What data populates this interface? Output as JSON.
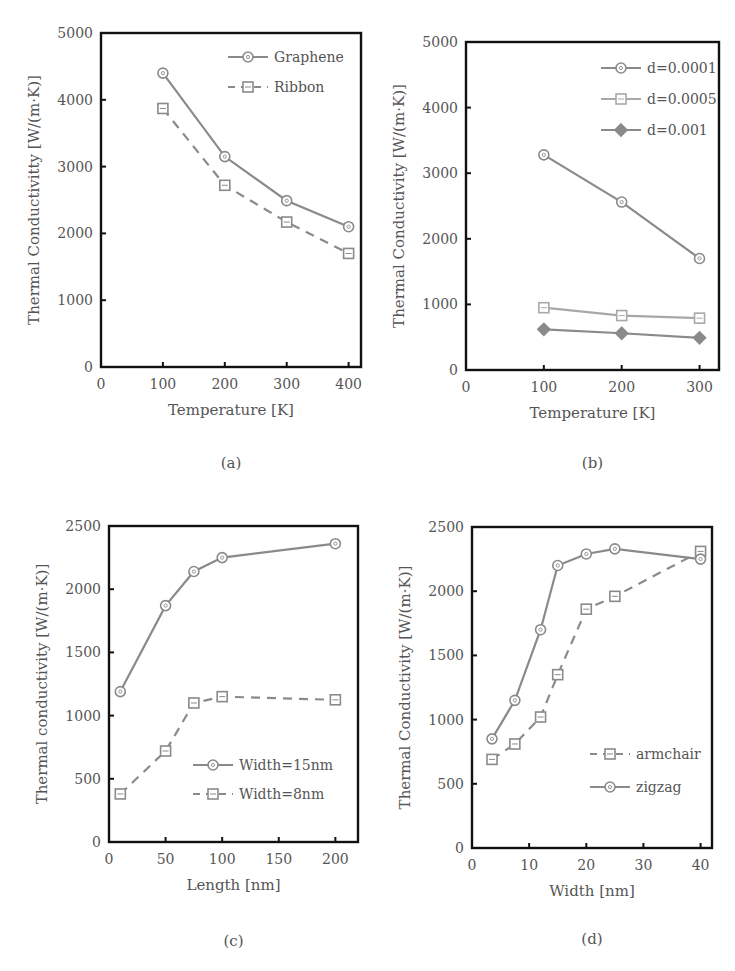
{
  "chart_data": [
    {
      "id": "a",
      "type": "line",
      "caption": "(a)",
      "title": "",
      "xlabel": "Temperature [K]",
      "ylabel": "Thermal Conductivitty [W/(m·K)]",
      "xlim": [
        0,
        420
      ],
      "ylim": [
        0,
        5000
      ],
      "xticks": [
        0,
        100,
        200,
        300,
        400
      ],
      "yticks": [
        0,
        1000,
        2000,
        3000,
        4000,
        5000
      ],
      "grid": false,
      "legend_position": "upper right",
      "series": [
        {
          "name": "Graphene",
          "marker": "circle",
          "dash": false,
          "x": [
            100,
            200,
            300,
            400
          ],
          "values": [
            4400,
            3150,
            2490,
            2100
          ]
        },
        {
          "name": "Ribbon",
          "marker": "square",
          "dash": true,
          "x": [
            100,
            200,
            300,
            400
          ],
          "values": [
            3870,
            2720,
            2170,
            1700
          ]
        }
      ]
    },
    {
      "id": "b",
      "type": "line",
      "caption": "(b)",
      "title": "",
      "xlabel": "Temperature [K]",
      "ylabel": "Thermal Conductivity [W/(m·K)]",
      "xlim": [
        0,
        325
      ],
      "ylim": [
        0,
        5000
      ],
      "xticks": [
        0,
        100,
        200,
        300
      ],
      "yticks": [
        0,
        1000,
        2000,
        3000,
        4000,
        5000
      ],
      "grid": false,
      "legend_position": "upper right",
      "series": [
        {
          "name": "d=0.0001",
          "marker": "circle",
          "dash": false,
          "x": [
            100,
            200,
            300
          ],
          "values": [
            3280,
            2560,
            1700
          ]
        },
        {
          "name": "d=0.0005",
          "marker": "square",
          "dash": false,
          "x": [
            100,
            200,
            300
          ],
          "values": [
            950,
            830,
            790
          ]
        },
        {
          "name": "d=0.001",
          "marker": "diamond",
          "dash": false,
          "x": [
            100,
            200,
            300
          ],
          "values": [
            620,
            560,
            490
          ]
        }
      ]
    },
    {
      "id": "c",
      "type": "line",
      "caption": "(c)",
      "title": "",
      "xlabel": "Length [nm]",
      "ylabel": "Thermal conductivity [W/(m·K)]",
      "xlim": [
        0,
        220
      ],
      "ylim": [
        0,
        2500
      ],
      "xticks": [
        0,
        50,
        100,
        150,
        200
      ],
      "yticks": [
        0,
        500,
        1000,
        1500,
        2000,
        2500
      ],
      "grid": false,
      "legend_position": "lower right",
      "series": [
        {
          "name": "Width=15nm",
          "marker": "circle",
          "dash": false,
          "x": [
            10,
            50,
            75,
            100,
            200
          ],
          "values": [
            1190,
            1870,
            2140,
            2250,
            2360
          ]
        },
        {
          "name": "Width=8nm",
          "marker": "square",
          "dash": true,
          "x": [
            10,
            50,
            75,
            100,
            200
          ],
          "values": [
            380,
            720,
            1100,
            1150,
            1125
          ]
        }
      ]
    },
    {
      "id": "d",
      "type": "line",
      "caption": "(d)",
      "title": "",
      "xlabel": "Width [nm]",
      "ylabel": "Thermal Conductivity [W/(m·K)]",
      "xlim": [
        0,
        42
      ],
      "ylim": [
        0,
        2500
      ],
      "xticks": [
        0,
        10,
        20,
        30,
        40
      ],
      "yticks": [
        0,
        500,
        1000,
        1500,
        2000,
        2500
      ],
      "grid": false,
      "legend_position": "lower right",
      "series": [
        {
          "name": "armchair",
          "marker": "square",
          "dash": true,
          "x": [
            3.5,
            7.5,
            12,
            15,
            20,
            25,
            40
          ],
          "values": [
            690,
            810,
            1020,
            1350,
            1860,
            1960,
            2310
          ]
        },
        {
          "name": "zigzag",
          "marker": "circle",
          "dash": false,
          "x": [
            3.5,
            7.5,
            12,
            15,
            20,
            25,
            40
          ],
          "values": [
            850,
            1150,
            1700,
            2200,
            2290,
            2330,
            2250
          ]
        }
      ]
    }
  ],
  "layout": {
    "panels": [
      {
        "frame": {
          "left": 101,
          "top": 33,
          "right": 361,
          "bottom": 367
        },
        "legend": {
          "x": 228,
          "y": 57,
          "gap": 30
        },
        "caption_y": 468
      },
      {
        "frame": {
          "left": 466,
          "top": 42,
          "right": 719,
          "bottom": 370
        },
        "legend": {
          "x": 601,
          "y": 68,
          "gap": 31
        },
        "caption_y": 468
      },
      {
        "frame": {
          "left": 109,
          "top": 526,
          "right": 358,
          "bottom": 842
        },
        "legend": {
          "x": 193,
          "y": 765,
          "gap": 29
        },
        "caption_y": 946
      },
      {
        "frame": {
          "left": 472,
          "top": 527,
          "right": 712,
          "bottom": 848
        },
        "legend": {
          "x": 590,
          "y": 754,
          "gap": 33
        },
        "caption_y": 944
      }
    ]
  },
  "colors": {
    "series": "#8a8a8a",
    "series_light": "#a8a8a8",
    "frame": "#111111",
    "text": "#555555"
  }
}
